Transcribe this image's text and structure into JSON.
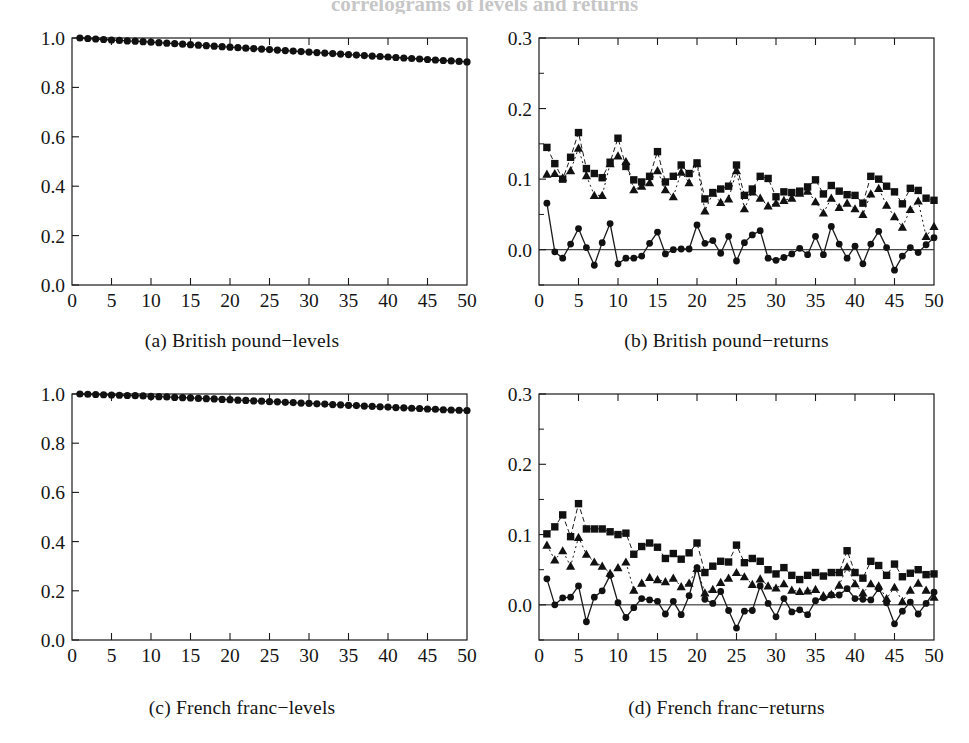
{
  "figure": {
    "cut_title": "correlograms of levels and returns",
    "panels": [
      {
        "key": "a",
        "caption": "(a) British pound−levels"
      },
      {
        "key": "b",
        "caption": "(b) British pound−returns"
      },
      {
        "key": "c",
        "caption": "(c) French franc−levels"
      },
      {
        "key": "d",
        "caption": "(d) French franc−returns"
      }
    ]
  },
  "chart_data": [
    {
      "id": "panel-a",
      "type": "line",
      "title": "(a) British pound−levels",
      "xlabel": "",
      "ylabel": "",
      "xlim": [
        0,
        50
      ],
      "ylim": [
        0.0,
        1.0
      ],
      "xticks": [
        0,
        5,
        10,
        15,
        20,
        25,
        30,
        35,
        40,
        45,
        50
      ],
      "xticklabels": [
        "0",
        "5",
        "10",
        "15",
        "20",
        "25",
        "30",
        "35",
        "40",
        "45",
        "50"
      ],
      "yticks": [
        0.0,
        0.2,
        0.4,
        0.6,
        0.8,
        1.0
      ],
      "yticklabels": [
        "0.0",
        "0.2",
        "0.4",
        "0.6",
        "0.8",
        "1.0"
      ],
      "grid": false,
      "legend": "none",
      "x": [
        1,
        2,
        3,
        4,
        5,
        6,
        7,
        8,
        9,
        10,
        11,
        12,
        13,
        14,
        15,
        16,
        17,
        18,
        19,
        20,
        21,
        22,
        23,
        24,
        25,
        26,
        27,
        28,
        29,
        30,
        31,
        32,
        33,
        34,
        35,
        36,
        37,
        38,
        39,
        40,
        41,
        42,
        43,
        44,
        45,
        46,
        47,
        48,
        49,
        50
      ],
      "series": [
        {
          "name": "levels autocorrelation",
          "marker": "circle",
          "linestyle": "solid",
          "values": [
            1.0,
            0.998,
            0.996,
            0.994,
            0.992,
            0.99,
            0.988,
            0.987,
            0.985,
            0.983,
            0.981,
            0.979,
            0.977,
            0.975,
            0.973,
            0.971,
            0.969,
            0.967,
            0.965,
            0.963,
            0.961,
            0.959,
            0.957,
            0.955,
            0.953,
            0.951,
            0.949,
            0.947,
            0.945,
            0.943,
            0.941,
            0.939,
            0.937,
            0.935,
            0.933,
            0.931,
            0.929,
            0.927,
            0.925,
            0.923,
            0.921,
            0.919,
            0.917,
            0.915,
            0.913,
            0.911,
            0.909,
            0.907,
            0.905,
            0.903
          ]
        }
      ]
    },
    {
      "id": "panel-b",
      "type": "line",
      "title": "(b) British pound−returns",
      "xlabel": "",
      "ylabel": "",
      "xlim": [
        0,
        50
      ],
      "ylim": [
        -0.05,
        0.3
      ],
      "xticks": [
        0,
        5,
        10,
        15,
        20,
        25,
        30,
        35,
        40,
        45,
        50
      ],
      "xticklabels": [
        "0",
        "5",
        "10",
        "15",
        "20",
        "25",
        "30",
        "35",
        "40",
        "45",
        "50"
      ],
      "yticks": [
        0.0,
        0.1,
        0.2,
        0.3
      ],
      "yticklabels": [
        "0.0",
        "0.1",
        "0.2",
        "0.3"
      ],
      "zero_line": 0.0,
      "grid": false,
      "legend": "none",
      "x": [
        1,
        2,
        3,
        4,
        5,
        6,
        7,
        8,
        9,
        10,
        11,
        12,
        13,
        14,
        15,
        16,
        17,
        18,
        19,
        20,
        21,
        22,
        23,
        24,
        25,
        26,
        27,
        28,
        29,
        30,
        31,
        32,
        33,
        34,
        35,
        36,
        37,
        38,
        39,
        40,
        41,
        42,
        43,
        44,
        45,
        46,
        47,
        48,
        49,
        50
      ],
      "series": [
        {
          "name": "returns",
          "marker": "circle",
          "linestyle": "solid",
          "values": [
            0.066,
            -0.003,
            -0.012,
            0.008,
            0.03,
            0.003,
            -0.022,
            0.01,
            0.037,
            -0.02,
            -0.012,
            -0.012,
            -0.009,
            0.009,
            0.025,
            -0.006,
            0.0,
            0.001,
            0.001,
            0.035,
            0.009,
            0.013,
            -0.005,
            0.019,
            -0.016,
            0.01,
            0.021,
            0.027,
            -0.012,
            -0.015,
            -0.011,
            -0.006,
            0.002,
            -0.007,
            0.019,
            -0.007,
            0.033,
            0.008,
            -0.012,
            0.005,
            -0.02,
            0.008,
            0.026,
            0.003,
            -0.029,
            -0.009,
            0.003,
            -0.004,
            0.007,
            0.017
          ]
        },
        {
          "name": "absolute returns",
          "marker": "square",
          "linestyle": "dashed",
          "values": [
            0.145,
            0.122,
            0.1,
            0.131,
            0.166,
            0.115,
            0.108,
            0.102,
            0.124,
            0.158,
            0.118,
            0.099,
            0.096,
            0.104,
            0.139,
            0.096,
            0.104,
            0.12,
            0.108,
            0.123,
            0.072,
            0.081,
            0.086,
            0.09,
            0.12,
            0.077,
            0.086,
            0.104,
            0.101,
            0.075,
            0.082,
            0.081,
            0.083,
            0.089,
            0.099,
            0.079,
            0.091,
            0.083,
            0.078,
            0.077,
            0.066,
            0.104,
            0.1,
            0.09,
            0.082,
            0.065,
            0.087,
            0.084,
            0.073,
            0.07
          ]
        },
        {
          "name": "squared returns",
          "marker": "triangle",
          "linestyle": "dotted",
          "values": [
            0.107,
            0.108,
            0.102,
            0.112,
            0.144,
            0.105,
            0.077,
            0.077,
            0.122,
            0.133,
            0.125,
            0.085,
            0.09,
            0.095,
            0.112,
            0.085,
            0.075,
            0.11,
            0.095,
            0.122,
            0.055,
            0.08,
            0.067,
            0.072,
            0.112,
            0.058,
            0.082,
            0.073,
            0.062,
            0.066,
            0.07,
            0.073,
            0.08,
            0.083,
            0.068,
            0.052,
            0.073,
            0.06,
            0.066,
            0.058,
            0.05,
            0.079,
            0.087,
            0.063,
            0.047,
            0.032,
            0.057,
            0.069,
            0.019,
            0.033
          ]
        }
      ]
    },
    {
      "id": "panel-c",
      "type": "line",
      "title": "(c) French franc−levels",
      "xlabel": "",
      "ylabel": "",
      "xlim": [
        0,
        50
      ],
      "ylim": [
        0.0,
        1.0
      ],
      "xticks": [
        0,
        5,
        10,
        15,
        20,
        25,
        30,
        35,
        40,
        45,
        50
      ],
      "xticklabels": [
        "0",
        "5",
        "10",
        "15",
        "20",
        "25",
        "30",
        "35",
        "40",
        "45",
        "50"
      ],
      "yticks": [
        0.0,
        0.2,
        0.4,
        0.6,
        0.8,
        1.0
      ],
      "yticklabels": [
        "0.0",
        "0.2",
        "0.4",
        "0.6",
        "0.8",
        "1.0"
      ],
      "grid": false,
      "legend": "none",
      "x": [
        1,
        2,
        3,
        4,
        5,
        6,
        7,
        8,
        9,
        10,
        11,
        12,
        13,
        14,
        15,
        16,
        17,
        18,
        19,
        20,
        21,
        22,
        23,
        24,
        25,
        26,
        27,
        28,
        29,
        30,
        31,
        32,
        33,
        34,
        35,
        36,
        37,
        38,
        39,
        40,
        41,
        42,
        43,
        44,
        45,
        46,
        47,
        48,
        49,
        50
      ],
      "series": [
        {
          "name": "levels autocorrelation",
          "marker": "circle",
          "linestyle": "solid",
          "values": [
            1.0,
            0.999,
            0.998,
            0.997,
            0.996,
            0.995,
            0.994,
            0.993,
            0.992,
            0.99,
            0.989,
            0.988,
            0.986,
            0.985,
            0.984,
            0.982,
            0.981,
            0.98,
            0.978,
            0.977,
            0.975,
            0.974,
            0.972,
            0.971,
            0.969,
            0.968,
            0.966,
            0.965,
            0.963,
            0.962,
            0.96,
            0.959,
            0.957,
            0.956,
            0.954,
            0.953,
            0.951,
            0.95,
            0.948,
            0.947,
            0.945,
            0.944,
            0.942,
            0.941,
            0.939,
            0.938,
            0.936,
            0.935,
            0.934,
            0.933
          ]
        }
      ]
    },
    {
      "id": "panel-d",
      "type": "line",
      "title": "(d) French franc−returns",
      "xlabel": "",
      "ylabel": "",
      "xlim": [
        0,
        50
      ],
      "ylim": [
        -0.05,
        0.3
      ],
      "xticks": [
        0,
        5,
        10,
        15,
        20,
        25,
        30,
        35,
        40,
        45,
        50
      ],
      "xticklabels": [
        "0",
        "5",
        "10",
        "15",
        "20",
        "25",
        "30",
        "35",
        "40",
        "45",
        "50"
      ],
      "yticks": [
        0.0,
        0.1,
        0.2,
        0.3
      ],
      "yticklabels": [
        "0.0",
        "0.1",
        "0.2",
        "0.3"
      ],
      "zero_line": 0.0,
      "grid": false,
      "legend": "none",
      "x": [
        1,
        2,
        3,
        4,
        5,
        6,
        7,
        8,
        9,
        10,
        11,
        12,
        13,
        14,
        15,
        16,
        17,
        18,
        19,
        20,
        21,
        22,
        23,
        24,
        25,
        26,
        27,
        28,
        29,
        30,
        31,
        32,
        33,
        34,
        35,
        36,
        37,
        38,
        39,
        40,
        41,
        42,
        43,
        44,
        45,
        46,
        47,
        48,
        49,
        50
      ],
      "series": [
        {
          "name": "returns",
          "marker": "circle",
          "linestyle": "solid",
          "values": [
            0.037,
            0.0,
            0.01,
            0.011,
            0.027,
            -0.024,
            0.011,
            0.02,
            0.042,
            0.003,
            -0.018,
            -0.004,
            0.009,
            0.007,
            0.005,
            -0.013,
            0.005,
            -0.014,
            0.013,
            0.053,
            0.008,
            0.002,
            0.019,
            -0.008,
            -0.033,
            -0.009,
            -0.008,
            0.027,
            0.002,
            -0.017,
            0.009,
            -0.01,
            -0.007,
            -0.014,
            0.006,
            0.01,
            0.014,
            0.014,
            0.023,
            0.009,
            0.008,
            0.007,
            0.023,
            0.003,
            -0.027,
            -0.009,
            0.004,
            -0.013,
            0.002,
            0.018
          ]
        },
        {
          "name": "absolute returns",
          "marker": "square",
          "linestyle": "dashed",
          "values": [
            0.101,
            0.111,
            0.128,
            0.097,
            0.144,
            0.108,
            0.108,
            0.108,
            0.104,
            0.1,
            0.102,
            0.072,
            0.083,
            0.088,
            0.082,
            0.066,
            0.073,
            0.065,
            0.074,
            0.088,
            0.046,
            0.055,
            0.062,
            0.061,
            0.085,
            0.06,
            0.066,
            0.062,
            0.05,
            0.044,
            0.053,
            0.042,
            0.036,
            0.042,
            0.046,
            0.041,
            0.046,
            0.046,
            0.077,
            0.046,
            0.038,
            0.062,
            0.056,
            0.042,
            0.058,
            0.04,
            0.045,
            0.05,
            0.043,
            0.044
          ]
        },
        {
          "name": "squared returns",
          "marker": "triangle",
          "linestyle": "dotted",
          "values": [
            0.085,
            0.064,
            0.077,
            0.055,
            0.096,
            0.072,
            0.061,
            0.055,
            0.045,
            0.053,
            0.061,
            0.021,
            0.031,
            0.039,
            0.036,
            0.033,
            0.038,
            0.026,
            0.031,
            0.052,
            0.017,
            0.022,
            0.032,
            0.038,
            0.046,
            0.04,
            0.029,
            0.037,
            0.027,
            0.024,
            0.03,
            0.021,
            0.019,
            0.02,
            0.022,
            0.013,
            0.015,
            0.028,
            0.054,
            0.03,
            0.017,
            0.03,
            0.027,
            0.009,
            0.025,
            0.005,
            0.021,
            0.031,
            0.021,
            0.011
          ]
        }
      ]
    }
  ]
}
